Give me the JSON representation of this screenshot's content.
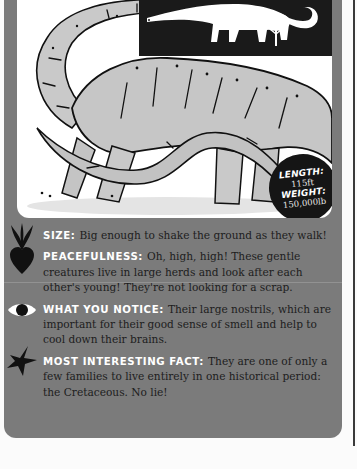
{
  "illustration": {
    "subject": "sauropod dinosaur",
    "silhouette_icons": [
      "dinosaur-silhouette-icon",
      "tree-icon"
    ]
  },
  "stats": {
    "length_label": "LENGTH:",
    "length_value": "115ft",
    "weight_label": "WEIGHT:",
    "weight_value": "150,000lb"
  },
  "facts": [
    {
      "icon": "plant-sprout-icon",
      "label": "SIZE:",
      "text": "Big enough to shake the ground as they walk!"
    },
    {
      "icon": "heart-icon",
      "label": "PEACEFULNESS:",
      "text": "Oh, high, high! These gentle creatures live in large herds and look after each other's young! They're not looking for a scrap."
    },
    {
      "icon": "eye-icon",
      "label": "WHAT YOU NOTICE:",
      "text": "Their large nostrils, which are important for their good sense of smell and help to cool down their brains."
    },
    {
      "icon": "star-icon",
      "label": "MOST INTERESTING FACT:",
      "text": "They are one of only a few families to live entirely in one historical period: the Cretaceous. No lie!"
    }
  ],
  "colors": {
    "card_gray": "#7b7b7b",
    "label_white": "#ffffff",
    "body_text": "#1d1d1d",
    "badge_black": "#151515"
  }
}
